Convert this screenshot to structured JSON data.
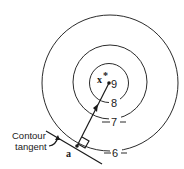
{
  "diagram": {
    "type": "contour-gradient",
    "contours": [
      {
        "label": "6",
        "level": 6
      },
      {
        "label": "7",
        "level": 7
      },
      {
        "label": "8",
        "level": 8
      }
    ],
    "center_point": {
      "label": "9",
      "optimum_label": "x",
      "optimum_superscript": "*"
    },
    "start_point": {
      "label": "a"
    },
    "annotation": {
      "line1": "Contour",
      "line2": "tangent"
    },
    "colors": {
      "stroke": "#2b2b2b",
      "background": "#ffffff"
    }
  }
}
